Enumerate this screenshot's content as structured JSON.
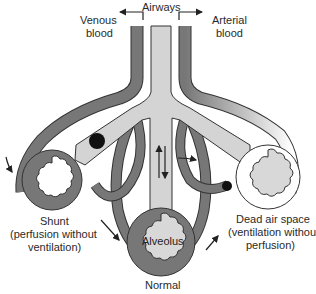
{
  "diagram": {
    "labels": {
      "airways": "Airways",
      "venous_line1": "Venous",
      "venous_line2": "blood",
      "arterial_line1": "Arterial",
      "arterial_line2": "blood",
      "alveolus": "Alveolus",
      "shunt_line1": "Shunt",
      "shunt_line2": "(perfusion without",
      "shunt_line3": "ventilation)",
      "dead_line1": "Dead air space",
      "dead_line2": "(ventilation without",
      "dead_line3": "perfusion)",
      "normal": "Normal"
    },
    "colors": {
      "vessel": "#777777",
      "airway": "#d4d4d4",
      "alveolus_fill": "#d8d8d8",
      "outline": "#333333",
      "blockage": "#111111",
      "background": "#ffffff"
    }
  }
}
